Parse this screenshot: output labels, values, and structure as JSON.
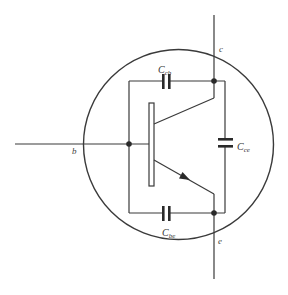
{
  "diagram": {
    "title": "",
    "type": "transistor-parasitic-capacitance-model",
    "colors": {
      "stroke": "#3a3a3a",
      "background": "#ffffff",
      "text": "#333333"
    },
    "terminals": {
      "base": {
        "label": "b"
      },
      "collector": {
        "label": "c"
      },
      "emitter": {
        "label": "e"
      }
    },
    "capacitors": {
      "cb": {
        "symbol": "C",
        "subscript": "cb"
      },
      "ce": {
        "symbol": "C",
        "subscript": "ce"
      },
      "be": {
        "symbol": "C",
        "subscript": "be"
      }
    },
    "components": [
      "bipolar-transistor-npn",
      "capacitor-collector-base",
      "capacitor-collector-emitter",
      "capacitor-base-emitter",
      "enclosing-circle"
    ]
  }
}
